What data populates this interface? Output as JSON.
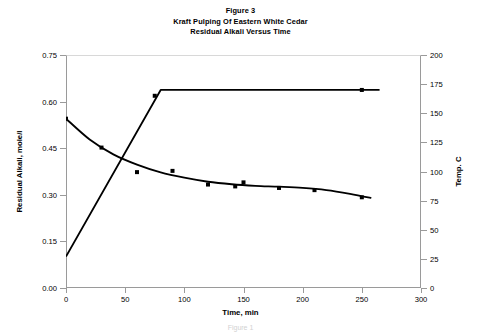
{
  "figure": {
    "title_lines": [
      "Figure 3",
      "Kraft Pulping Of Eastern White Cedar",
      "Residual Alkali Versus Time"
    ],
    "footer_partial": "Figure 1"
  },
  "chart_data": {
    "type": "line",
    "xlabel": "Time, min",
    "ylabel": "Residual Alkali, mole/l",
    "y2label": "Temp. C",
    "xlim": [
      0,
      300
    ],
    "ylim": [
      0.0,
      0.75
    ],
    "y2lim": [
      0,
      200
    ],
    "xticks": [
      0,
      50,
      100,
      150,
      200,
      250,
      300
    ],
    "xticklabels": [
      "0",
      "50",
      "100",
      "150",
      "200",
      "250",
      "300"
    ],
    "yticks": [
      0.0,
      0.15,
      0.3,
      0.45,
      0.6,
      0.75
    ],
    "yticklabels": [
      "0.00",
      "0.15",
      "0.30",
      "0.45",
      "0.60",
      "0.75"
    ],
    "y2ticks": [
      0,
      25,
      50,
      75,
      100,
      125,
      150,
      175,
      200
    ],
    "y2ticklabels": [
      "0",
      "25",
      "50",
      "75",
      "100",
      "125",
      "150",
      "175",
      "200"
    ],
    "grid": false,
    "legend": "none",
    "series": [
      {
        "name": "Residual Alkali",
        "axis": "left",
        "marker": "square",
        "color": "#000000",
        "points": [
          {
            "x": 0,
            "y": 0.545
          },
          {
            "x": 30,
            "y": 0.452
          },
          {
            "x": 60,
            "y": 0.373
          },
          {
            "x": 90,
            "y": 0.377
          },
          {
            "x": 120,
            "y": 0.333
          },
          {
            "x": 143,
            "y": 0.327
          },
          {
            "x": 150,
            "y": 0.34
          },
          {
            "x": 180,
            "y": 0.322
          },
          {
            "x": 210,
            "y": 0.315
          },
          {
            "x": 250,
            "y": 0.292
          }
        ],
        "fit_curve": [
          {
            "x": 0,
            "y": 0.545
          },
          {
            "x": 20,
            "y": 0.478
          },
          {
            "x": 40,
            "y": 0.43
          },
          {
            "x": 60,
            "y": 0.397
          },
          {
            "x": 80,
            "y": 0.372
          },
          {
            "x": 100,
            "y": 0.355
          },
          {
            "x": 120,
            "y": 0.342
          },
          {
            "x": 140,
            "y": 0.334
          },
          {
            "x": 160,
            "y": 0.329
          },
          {
            "x": 180,
            "y": 0.326
          },
          {
            "x": 200,
            "y": 0.322
          },
          {
            "x": 220,
            "y": 0.315
          },
          {
            "x": 240,
            "y": 0.303
          },
          {
            "x": 250,
            "y": 0.295
          },
          {
            "x": 258,
            "y": 0.29
          }
        ]
      },
      {
        "name": "Temperature",
        "axis": "right",
        "marker": "square",
        "color": "#000000",
        "points": [
          {
            "x": 75,
            "y": 165
          },
          {
            "x": 250,
            "y": 170
          }
        ],
        "fit_curve": [
          {
            "x": 0,
            "y": 27
          },
          {
            "x": 80,
            "y": 170
          },
          {
            "x": 265,
            "y": 170
          }
        ]
      }
    ]
  }
}
